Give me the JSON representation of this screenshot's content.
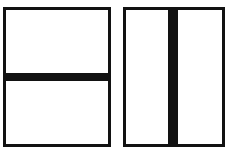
{
  "canvas": {
    "width": 229,
    "height": 152,
    "background_color": "#ffffff"
  },
  "style": {
    "stroke_color": "#121212",
    "fill_color": "#ffffff",
    "shadow_color": "#d6d6d6",
    "border_width_px": 3
  },
  "figures": [
    {
      "id": "figure-left",
      "name": "rectangle-with-horizontal-divider",
      "shape": "rectangle",
      "x": 3,
      "y": 7,
      "width": 108,
      "height": 140,
      "divider": {
        "orientation": "horizontal",
        "thickness_px": 8,
        "offset_px": 63,
        "position": "below-center",
        "spans_full_width": true,
        "color": "#121212"
      },
      "regions": 2,
      "caption": ""
    },
    {
      "id": "figure-right",
      "name": "rectangle-with-vertical-divider",
      "shape": "rectangle",
      "x": 123,
      "y": 7,
      "width": 102,
      "height": 140,
      "divider": {
        "orientation": "vertical",
        "thickness_px": 10,
        "offset_px": 42,
        "position": "left-of-center",
        "spans_full_height": true,
        "color": "#121212"
      },
      "regions": 2,
      "caption": ""
    }
  ]
}
